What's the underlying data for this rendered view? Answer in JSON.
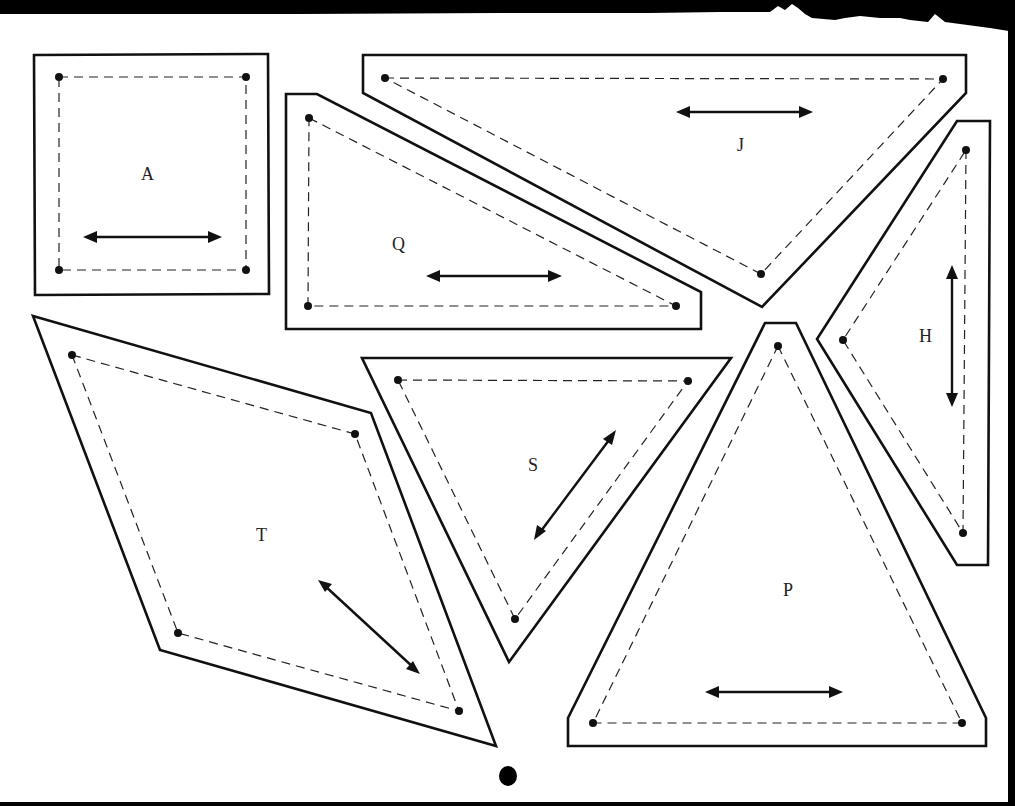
{
  "document": {
    "type": "quilt-template-sheet",
    "style": {
      "paper": "#ffffff",
      "ink": "#111111",
      "scan_border": "#000000"
    },
    "legend": {
      "solid_line": "cutting line",
      "dashed_line": "seam / sewing line",
      "dots": "seam intersection points",
      "double_arrow": "grain line"
    }
  },
  "pieces": [
    {
      "id": "A",
      "label": "A",
      "shape": "square",
      "grain": "horizontal"
    },
    {
      "id": "J",
      "label": "J",
      "shape": "triangle (pointing down)",
      "grain": "horizontal"
    },
    {
      "id": "Q",
      "label": "Q",
      "shape": "right triangle",
      "grain": "horizontal"
    },
    {
      "id": "H",
      "label": "H",
      "shape": "triangle (pointing left)",
      "grain": "vertical"
    },
    {
      "id": "T",
      "label": "T",
      "shape": "parallelogram / diamond",
      "grain": "diagonal"
    },
    {
      "id": "S",
      "label": "S",
      "shape": "triangle (pointing down)",
      "grain": "diagonal"
    },
    {
      "id": "P",
      "label": "P",
      "shape": "triangle (pointing up)",
      "grain": "horizontal"
    }
  ],
  "marks": {
    "registration_dot": "bottom-center punch mark"
  }
}
